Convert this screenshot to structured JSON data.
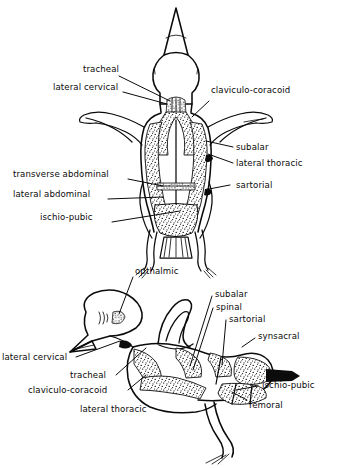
{
  "figure": {
    "background_color": "#ffffff",
    "ink_color": "#0b0b0b",
    "views": [
      {
        "name": "ventral-view",
        "position": "top"
      },
      {
        "name": "lateral-view",
        "position": "bottom"
      }
    ]
  },
  "top_view_labels": {
    "tracheal": "tracheal",
    "lateral_cervical": "lateral cervical",
    "claviculo_coracoid": "claviculo-coracoid",
    "subalar": "subalar",
    "lateral_thoracic": "lateral thoracic",
    "sartorial": "sartorial",
    "transverse_abdominal": "transverse  abdominal",
    "lateral_abdominal": "lateral abdominal",
    "ischio_pubic": "ischio-pubic"
  },
  "bottom_view_labels": {
    "opthalmic": "opthalmic",
    "subalar": "subalar",
    "spinal": "spinal",
    "sartorial": "sartorial",
    "synsacral": "synsacral",
    "lateral_cervical": "lateral cervical",
    "tracheal": "tracheal",
    "claviculo_coracoid": "claviculo-coracoid",
    "lateral_thoracic": "lateral thoracic",
    "ischio_pubic": "ischio-pubic",
    "femoral": "femoral"
  }
}
